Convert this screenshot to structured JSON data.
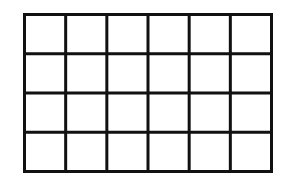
{
  "diagram": {
    "type": "grid",
    "rows": 4,
    "columns": 6,
    "line_color": "#111111",
    "background": "#ffffff",
    "cells_filled": 0
  }
}
